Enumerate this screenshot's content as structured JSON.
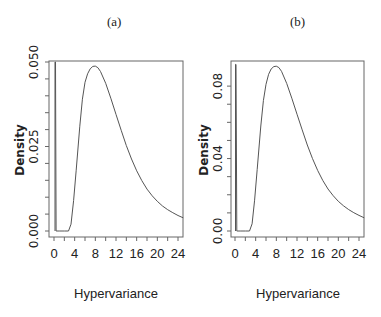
{
  "chart_data": [
    {
      "type": "line",
      "panel": "(a)",
      "title": "(a)",
      "xlabel": "Hypervariance",
      "ylabel": "Density",
      "xlim": [
        0,
        25
      ],
      "ylim": [
        0,
        0.05
      ],
      "xticks": [
        0,
        4,
        8,
        12,
        16,
        20,
        24
      ],
      "xtick_minor": [
        2,
        6,
        10,
        14,
        18,
        22
      ],
      "yticks": [
        0.0,
        0.025,
        0.05
      ],
      "ytick_labels": [
        "0.000",
        "0.025",
        "0.050"
      ],
      "ytick_minor": [
        0.005,
        0.01,
        0.015,
        0.02,
        0.03,
        0.035,
        0.04,
        0.045
      ],
      "grid": false,
      "x": [
        0.2,
        0.3,
        0.4,
        1,
        2,
        2.8,
        3.3,
        3.8,
        4.3,
        5,
        5.5,
        6,
        6.5,
        7,
        7.5,
        8,
        8.5,
        9,
        10,
        11,
        12,
        13,
        14,
        15,
        16,
        17,
        18,
        19,
        20,
        21,
        22,
        23,
        24,
        25
      ],
      "y": [
        0.05,
        0.05,
        0.0,
        0.0,
        0.0,
        0.0,
        0.002,
        0.009,
        0.018,
        0.031,
        0.039,
        0.044,
        0.0465,
        0.048,
        0.0487,
        0.0488,
        0.0483,
        0.0472,
        0.0437,
        0.0393,
        0.0345,
        0.0298,
        0.0253,
        0.0213,
        0.0178,
        0.0149,
        0.0124,
        0.0104,
        0.0088,
        0.0074,
        0.0063,
        0.0054,
        0.0046,
        0.0039
      ]
    },
    {
      "type": "line",
      "panel": "(b)",
      "title": "(b)",
      "xlabel": "Hypervariance",
      "ylabel": "Density",
      "xlim": [
        0,
        25
      ],
      "ylim": [
        0,
        0.092
      ],
      "xticks": [
        0,
        4,
        8,
        12,
        16,
        20,
        24
      ],
      "xtick_minor": [
        2,
        6,
        10,
        14,
        18,
        22
      ],
      "yticks": [
        0.0,
        0.04,
        0.08
      ],
      "ytick_labels": [
        "0.00",
        "0.04",
        "0.08"
      ],
      "ytick_minor": [
        0.01,
        0.02,
        0.03,
        0.05,
        0.06,
        0.07
      ],
      "grid": false,
      "x": [
        0.1,
        0.2,
        0.35,
        1,
        2,
        2.8,
        3.3,
        3.8,
        4.3,
        5,
        5.5,
        6,
        6.5,
        7,
        7.5,
        8,
        8.5,
        9,
        10,
        11,
        12,
        13,
        14,
        15,
        16,
        17,
        18,
        19,
        20,
        21,
        22,
        23,
        24,
        25
      ],
      "y": [
        0.092,
        0.092,
        0.0,
        0.0,
        0.0,
        0.0,
        0.004,
        0.017,
        0.034,
        0.058,
        0.072,
        0.081,
        0.0865,
        0.0895,
        0.0908,
        0.091,
        0.0902,
        0.0882,
        0.0815,
        0.0733,
        0.0645,
        0.0558,
        0.0475,
        0.04,
        0.0334,
        0.0279,
        0.0232,
        0.0195,
        0.0164,
        0.0139,
        0.0118,
        0.0101,
        0.0086,
        0.0073
      ]
    }
  ]
}
